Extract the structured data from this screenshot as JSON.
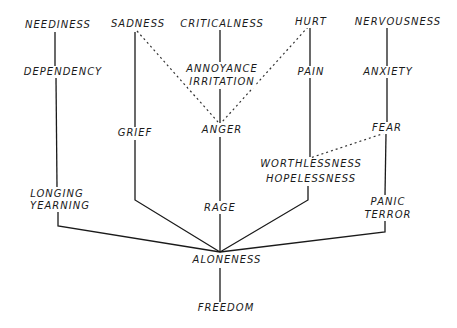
{
  "diagram": {
    "type": "emotion-tree",
    "colors": {
      "ink": "#1a1a1a",
      "background": "#ffffff"
    },
    "top_row": {
      "neediness": "NEEDINESS",
      "sadness": "SADNESS",
      "criticalness": "CRITICALNESS",
      "hurt": "HURT",
      "nervousness": "NERVOUSNESS"
    },
    "second_row": {
      "dependency": "DEPENDENCY",
      "annoyance": "ANNOYANCE",
      "irritation": "IRRITATION",
      "pain": "PAIN",
      "anxiety": "ANXIETY"
    },
    "third_row": {
      "grief": "GRIEF",
      "anger": "ANGER",
      "fear": "FEAR",
      "worthlessness": "WORTHLESSNESS",
      "hopelessness": "HOPELESSNESS"
    },
    "fourth_row": {
      "longing": "LONGING",
      "yearning": "YEARNING",
      "rage": "RAGE",
      "panic": "PANIC",
      "terror": "TERROR"
    },
    "root": "ALONENESS",
    "bottom": "FREEDOM",
    "edges": {
      "solid": [
        [
          "NEEDINESS",
          "DEPENDENCY"
        ],
        [
          "DEPENDENCY",
          "LONGING/YEARNING"
        ],
        [
          "LONGING/YEARNING",
          "ALONENESS"
        ],
        [
          "SADNESS",
          "GRIEF"
        ],
        [
          "GRIEF",
          "ALONENESS"
        ],
        [
          "CRITICALNESS",
          "ANNOYANCE/IRRITATION"
        ],
        [
          "ANNOYANCE/IRRITATION",
          "ANGER"
        ],
        [
          "ANGER",
          "RAGE"
        ],
        [
          "RAGE",
          "ALONENESS"
        ],
        [
          "HURT",
          "PAIN"
        ],
        [
          "PAIN",
          "WORTHLESSNESS/HOPELESSNESS"
        ],
        [
          "WORTHLESSNESS/HOPELESSNESS",
          "ALONENESS"
        ],
        [
          "NERVOUSNESS",
          "ANXIETY"
        ],
        [
          "ANXIETY",
          "FEAR"
        ],
        [
          "FEAR",
          "PANIC/TERROR"
        ],
        [
          "PANIC/TERROR",
          "ALONENESS"
        ],
        [
          "ALONENESS",
          "FREEDOM"
        ]
      ],
      "dashed": [
        [
          "SADNESS",
          "ANGER"
        ],
        [
          "HURT",
          "ANGER"
        ],
        [
          "FEAR",
          "WORTHLESSNESS/HOPELESSNESS"
        ]
      ]
    }
  }
}
